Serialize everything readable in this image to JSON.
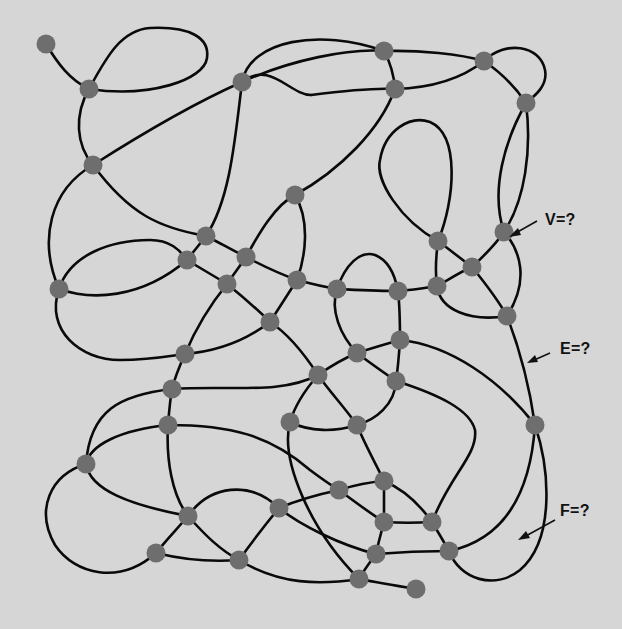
{
  "diagram": {
    "type": "planar-graph",
    "background_color": "#d6d6d6",
    "edge_color": "#0a0a0a",
    "node_color": "#6e6e6e",
    "labels": {
      "vertices": "V=?",
      "edges": "E=?",
      "faces": "F=?"
    },
    "nodes": [
      {
        "id": 1,
        "x": 46,
        "y": 44
      },
      {
        "id": 2,
        "x": 89,
        "y": 89
      },
      {
        "id": 3,
        "x": 93,
        "y": 165
      },
      {
        "id": 4,
        "x": 242,
        "y": 82
      },
      {
        "id": 5,
        "x": 384,
        "y": 51
      },
      {
        "id": 6,
        "x": 395,
        "y": 89
      },
      {
        "id": 7,
        "x": 484,
        "y": 61
      },
      {
        "id": 8,
        "x": 526,
        "y": 103
      },
      {
        "id": 9,
        "x": 295,
        "y": 195
      },
      {
        "id": 10,
        "x": 206,
        "y": 236
      },
      {
        "id": 11,
        "x": 187,
        "y": 260
      },
      {
        "id": 12,
        "x": 246,
        "y": 257
      },
      {
        "id": 13,
        "x": 227,
        "y": 284
      },
      {
        "id": 14,
        "x": 59,
        "y": 289
      },
      {
        "id": 15,
        "x": 297,
        "y": 280
      },
      {
        "id": 16,
        "x": 270,
        "y": 322
      },
      {
        "id": 17,
        "x": 337,
        "y": 289
      },
      {
        "id": 18,
        "x": 398,
        "y": 291
      },
      {
        "id": 19,
        "x": 438,
        "y": 241
      },
      {
        "id": 20,
        "x": 472,
        "y": 267
      },
      {
        "id": 21,
        "x": 437,
        "y": 286
      },
      {
        "id": 22,
        "x": 504,
        "y": 232
      },
      {
        "id": 23,
        "x": 507,
        "y": 316
      },
      {
        "id": 24,
        "x": 185,
        "y": 354
      },
      {
        "id": 25,
        "x": 172,
        "y": 389
      },
      {
        "id": 26,
        "x": 168,
        "y": 425
      },
      {
        "id": 27,
        "x": 357,
        "y": 353
      },
      {
        "id": 28,
        "x": 400,
        "y": 340
      },
      {
        "id": 29,
        "x": 318,
        "y": 375
      },
      {
        "id": 30,
        "x": 396,
        "y": 381
      },
      {
        "id": 31,
        "x": 290,
        "y": 422
      },
      {
        "id": 32,
        "x": 357,
        "y": 425
      },
      {
        "id": 33,
        "x": 535,
        "y": 425
      },
      {
        "id": 34,
        "x": 86,
        "y": 464
      },
      {
        "id": 35,
        "x": 188,
        "y": 516
      },
      {
        "id": 36,
        "x": 156,
        "y": 553
      },
      {
        "id": 37,
        "x": 239,
        "y": 560
      },
      {
        "id": 38,
        "x": 279,
        "y": 508
      },
      {
        "id": 39,
        "x": 339,
        "y": 490
      },
      {
        "id": 40,
        "x": 384,
        "y": 481
      },
      {
        "id": 41,
        "x": 384,
        "y": 522
      },
      {
        "id": 42,
        "x": 432,
        "y": 522
      },
      {
        "id": 43,
        "x": 376,
        "y": 554
      },
      {
        "id": 44,
        "x": 449,
        "y": 551
      },
      {
        "id": 45,
        "x": 359,
        "y": 579
      },
      {
        "id": 46,
        "x": 416,
        "y": 589
      }
    ],
    "node_radius": 9.5
  }
}
